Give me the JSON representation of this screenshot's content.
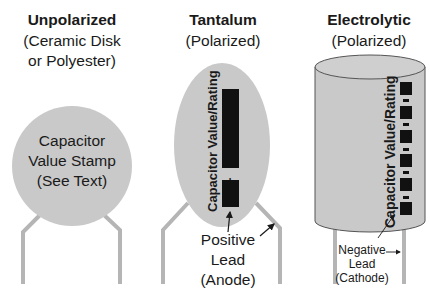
{
  "colors": {
    "body_fill": "#c9c9c9",
    "lead": "#b5b5b5",
    "marking": "#111111",
    "text": "#1a1a1a",
    "outline": "#555555"
  },
  "unpolarized": {
    "title": "Unpolarized",
    "subtitle_1": "(Ceramic Disk",
    "subtitle_2": "or Polyester)",
    "body_label_1": "Capacitor",
    "body_label_2": "Value Stamp",
    "body_label_3": "(See Text)"
  },
  "tantalum": {
    "title": "Tantalum",
    "subtitle": "(Polarized)",
    "vertical_label": "Capacitor Value/Rating",
    "plus_sign": "+",
    "lead_label_1": "Positive",
    "lead_label_2": "Lead",
    "lead_label_3": "(Anode)"
  },
  "electrolytic": {
    "title": "Electrolytic",
    "subtitle": "(Polarized)",
    "vertical_label": "Capacitor Value/Rating",
    "stripe_marks": 6,
    "lead_label_1": "Negative",
    "lead_label_2": "Lead",
    "lead_label_3": "(Cathode)"
  }
}
